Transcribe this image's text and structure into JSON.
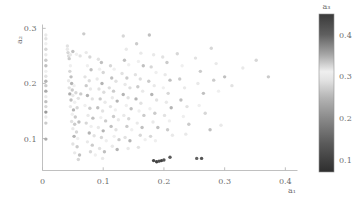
{
  "figure": {
    "background": "#ffffff",
    "point_marker": "circle",
    "colormap": "gray-cyclic-dark-light-dark"
  },
  "axes": {
    "x": {
      "label": "a₁",
      "ticks": [
        "0",
        "0.1",
        "0.2",
        "0.3",
        "0.4"
      ],
      "tick_values": [
        0,
        0.1,
        0.2,
        0.3,
        0.4
      ],
      "range": [
        0.0,
        0.42
      ]
    },
    "y": {
      "label": "a₂",
      "ticks": [
        "0.1",
        "0.2",
        "0.3"
      ],
      "tick_values": [
        0.1,
        0.2,
        0.3
      ],
      "range": [
        0.042,
        0.307
      ]
    }
  },
  "colorbar": {
    "label": "a₃",
    "ticks": [
      "0.1",
      "0.2",
      "0.3",
      "0.4"
    ],
    "tick_values": [
      0.1,
      0.2,
      0.3,
      0.4
    ],
    "range": [
      0.07,
      0.45
    ],
    "orientation": "vertical",
    "position": "right",
    "stops": [
      {
        "value": 0.45,
        "color": "#3a3a3a"
      },
      {
        "value": 0.4,
        "color": "#5f5f5f"
      },
      {
        "value": 0.35,
        "color": "#a8a8a8"
      },
      {
        "value": 0.31,
        "color": "#efefef"
      },
      {
        "value": 0.29,
        "color": "#e2e2e2"
      },
      {
        "value": 0.25,
        "color": "#b4b4b4"
      },
      {
        "value": 0.2,
        "color": "#8a8a8a"
      },
      {
        "value": 0.14,
        "color": "#5a5a5a"
      },
      {
        "value": 0.07,
        "color": "#2e2e2e"
      }
    ]
  },
  "chart_data": {
    "type": "scatter",
    "title": "",
    "xlabel": "a₁",
    "ylabel": "a₂",
    "clabel": "a₃",
    "xlim": [
      0.0,
      0.42
    ],
    "ylim": [
      0.042,
      0.307
    ],
    "clim": [
      0.07,
      0.45
    ],
    "grid": false,
    "legend": "none",
    "colorbar_position": "right",
    "series_name": "samples",
    "n_points": 196,
    "points": [
      [
        0.0055,
        0.288,
        0.3
      ],
      [
        0.0055,
        0.281,
        0.29
      ],
      [
        0.0055,
        0.272,
        0.31
      ],
      [
        0.0055,
        0.262,
        0.28
      ],
      [
        0.0055,
        0.252,
        0.3
      ],
      [
        0.0055,
        0.242,
        0.27
      ],
      [
        0.0055,
        0.232,
        0.26
      ],
      [
        0.0055,
        0.222,
        0.31
      ],
      [
        0.0055,
        0.213,
        0.29
      ],
      [
        0.0055,
        0.204,
        0.25
      ],
      [
        0.0055,
        0.196,
        0.33
      ],
      [
        0.0055,
        0.186,
        0.24
      ],
      [
        0.0055,
        0.176,
        0.3
      ],
      [
        0.0055,
        0.167,
        0.26
      ],
      [
        0.0055,
        0.158,
        0.28
      ],
      [
        0.0055,
        0.148,
        0.22
      ],
      [
        0.0055,
        0.139,
        0.3
      ],
      [
        0.0055,
        0.128,
        0.27
      ],
      [
        0.0055,
        0.099,
        0.24
      ],
      [
        0.041,
        0.268,
        0.29
      ],
      [
        0.041,
        0.262,
        0.3
      ],
      [
        0.042,
        0.256,
        0.28
      ],
      [
        0.043,
        0.25,
        0.32
      ],
      [
        0.044,
        0.245,
        0.27
      ],
      [
        0.046,
        0.252,
        0.3
      ],
      [
        0.05,
        0.258,
        0.26
      ],
      [
        0.056,
        0.253,
        0.31
      ],
      [
        0.062,
        0.25,
        0.29
      ],
      [
        0.046,
        0.232,
        0.31
      ],
      [
        0.045,
        0.222,
        0.28
      ],
      [
        0.047,
        0.212,
        0.26
      ],
      [
        0.043,
        0.205,
        0.3
      ],
      [
        0.048,
        0.2,
        0.25
      ],
      [
        0.044,
        0.192,
        0.29
      ],
      [
        0.049,
        0.188,
        0.27
      ],
      [
        0.052,
        0.196,
        0.31
      ],
      [
        0.045,
        0.181,
        0.24
      ],
      [
        0.05,
        0.178,
        0.3
      ],
      [
        0.055,
        0.183,
        0.28
      ],
      [
        0.047,
        0.17,
        0.26
      ],
      [
        0.053,
        0.166,
        0.31
      ],
      [
        0.059,
        0.173,
        0.29
      ],
      [
        0.063,
        0.181,
        0.27
      ],
      [
        0.046,
        0.158,
        0.3
      ],
      [
        0.051,
        0.152,
        0.25
      ],
      [
        0.057,
        0.156,
        0.28
      ],
      [
        0.049,
        0.144,
        0.31
      ],
      [
        0.054,
        0.139,
        0.27
      ],
      [
        0.048,
        0.131,
        0.29
      ],
      [
        0.053,
        0.126,
        0.33
      ],
      [
        0.06,
        0.13,
        0.26
      ],
      [
        0.05,
        0.118,
        0.3
      ],
      [
        0.056,
        0.112,
        0.28
      ],
      [
        0.052,
        0.104,
        0.25
      ],
      [
        0.058,
        0.1,
        0.31
      ],
      [
        0.05,
        0.09,
        0.29
      ],
      [
        0.057,
        0.085,
        0.27
      ],
      [
        0.053,
        0.074,
        0.3
      ],
      [
        0.061,
        0.07,
        0.26
      ],
      [
        0.059,
        0.062,
        0.28
      ],
      [
        0.068,
        0.29,
        0.27
      ],
      [
        0.072,
        0.256,
        0.3
      ],
      [
        0.078,
        0.248,
        0.28
      ],
      [
        0.074,
        0.232,
        0.31
      ],
      [
        0.08,
        0.225,
        0.26
      ],
      [
        0.07,
        0.212,
        0.29
      ],
      [
        0.077,
        0.205,
        0.32
      ],
      [
        0.072,
        0.196,
        0.27
      ],
      [
        0.079,
        0.19,
        0.3
      ],
      [
        0.074,
        0.178,
        0.25
      ],
      [
        0.082,
        0.172,
        0.29
      ],
      [
        0.07,
        0.16,
        0.31
      ],
      [
        0.078,
        0.155,
        0.27
      ],
      [
        0.075,
        0.142,
        0.3
      ],
      [
        0.083,
        0.137,
        0.26
      ],
      [
        0.072,
        0.128,
        0.28
      ],
      [
        0.08,
        0.122,
        0.31
      ],
      [
        0.077,
        0.11,
        0.25
      ],
      [
        0.085,
        0.105,
        0.29
      ],
      [
        0.074,
        0.094,
        0.3
      ],
      [
        0.082,
        0.088,
        0.27
      ],
      [
        0.079,
        0.076,
        0.28
      ],
      [
        0.087,
        0.07,
        0.31
      ],
      [
        0.092,
        0.244,
        0.29
      ],
      [
        0.097,
        0.238,
        0.26
      ],
      [
        0.094,
        0.226,
        0.31
      ],
      [
        0.1,
        0.22,
        0.28
      ],
      [
        0.09,
        0.208,
        0.3
      ],
      [
        0.098,
        0.2,
        0.25
      ],
      [
        0.093,
        0.19,
        0.29
      ],
      [
        0.101,
        0.184,
        0.32
      ],
      [
        0.095,
        0.172,
        0.27
      ],
      [
        0.103,
        0.166,
        0.3
      ],
      [
        0.091,
        0.156,
        0.26
      ],
      [
        0.099,
        0.15,
        0.29
      ],
      [
        0.096,
        0.138,
        0.31
      ],
      [
        0.104,
        0.132,
        0.27
      ],
      [
        0.092,
        0.12,
        0.3
      ],
      [
        0.1,
        0.114,
        0.25
      ],
      [
        0.097,
        0.102,
        0.28
      ],
      [
        0.105,
        0.096,
        0.31
      ],
      [
        0.094,
        0.082,
        0.29
      ],
      [
        0.102,
        0.076,
        0.26
      ],
      [
        0.099,
        0.064,
        0.3
      ],
      [
        0.112,
        0.232,
        0.28
      ],
      [
        0.118,
        0.226,
        0.31
      ],
      [
        0.114,
        0.21,
        0.26
      ],
      [
        0.121,
        0.204,
        0.29
      ],
      [
        0.11,
        0.192,
        0.32
      ],
      [
        0.117,
        0.186,
        0.27
      ],
      [
        0.115,
        0.174,
        0.3
      ],
      [
        0.123,
        0.168,
        0.25
      ],
      [
        0.112,
        0.158,
        0.29
      ],
      [
        0.12,
        0.152,
        0.31
      ],
      [
        0.117,
        0.14,
        0.27
      ],
      [
        0.125,
        0.134,
        0.3
      ],
      [
        0.113,
        0.122,
        0.26
      ],
      [
        0.121,
        0.116,
        0.29
      ],
      [
        0.118,
        0.104,
        0.31
      ],
      [
        0.126,
        0.098,
        0.27
      ],
      [
        0.115,
        0.086,
        0.3
      ],
      [
        0.123,
        0.08,
        0.25
      ],
      [
        0.133,
        0.286,
        0.28
      ],
      [
        0.138,
        0.262,
        0.3
      ],
      [
        0.135,
        0.242,
        0.26
      ],
      [
        0.142,
        0.234,
        0.31
      ],
      [
        0.131,
        0.218,
        0.29
      ],
      [
        0.139,
        0.21,
        0.27
      ],
      [
        0.136,
        0.198,
        0.3
      ],
      [
        0.144,
        0.192,
        0.32
      ],
      [
        0.133,
        0.18,
        0.25
      ],
      [
        0.141,
        0.174,
        0.29
      ],
      [
        0.138,
        0.16,
        0.31
      ],
      [
        0.146,
        0.154,
        0.26
      ],
      [
        0.134,
        0.142,
        0.3
      ],
      [
        0.142,
        0.136,
        0.28
      ],
      [
        0.139,
        0.122,
        0.27
      ],
      [
        0.147,
        0.116,
        0.31
      ],
      [
        0.136,
        0.102,
        0.29
      ],
      [
        0.144,
        0.096,
        0.25
      ],
      [
        0.141,
        0.082,
        0.3
      ],
      [
        0.155,
        0.272,
        0.27
      ],
      [
        0.162,
        0.255,
        0.3
      ],
      [
        0.158,
        0.24,
        0.31
      ],
      [
        0.166,
        0.232,
        0.26
      ],
      [
        0.153,
        0.216,
        0.29
      ],
      [
        0.161,
        0.208,
        0.32
      ],
      [
        0.157,
        0.194,
        0.27
      ],
      [
        0.165,
        0.186,
        0.3
      ],
      [
        0.154,
        0.172,
        0.25
      ],
      [
        0.162,
        0.164,
        0.29
      ],
      [
        0.159,
        0.15,
        0.31
      ],
      [
        0.167,
        0.142,
        0.27
      ],
      [
        0.156,
        0.128,
        0.3
      ],
      [
        0.164,
        0.12,
        0.26
      ],
      [
        0.161,
        0.106,
        0.28
      ],
      [
        0.169,
        0.098,
        0.31
      ],
      [
        0.158,
        0.084,
        0.29
      ],
      [
        0.176,
        0.288,
        0.26
      ],
      [
        0.183,
        0.252,
        0.3
      ],
      [
        0.179,
        0.23,
        0.28
      ],
      [
        0.187,
        0.22,
        0.31
      ],
      [
        0.175,
        0.204,
        0.27
      ],
      [
        0.184,
        0.196,
        0.3
      ],
      [
        0.18,
        0.18,
        0.25
      ],
      [
        0.188,
        0.17,
        0.29
      ],
      [
        0.177,
        0.154,
        0.31
      ],
      [
        0.185,
        0.146,
        0.27
      ],
      [
        0.182,
        0.13,
        0.3
      ],
      [
        0.19,
        0.12,
        0.26
      ],
      [
        0.178,
        0.104,
        0.28
      ],
      [
        0.186,
        0.096,
        0.31
      ],
      [
        0.183,
        0.06,
        0.11
      ],
      [
        0.188,
        0.058,
        0.1
      ],
      [
        0.192,
        0.059,
        0.12
      ],
      [
        0.196,
        0.06,
        0.1
      ],
      [
        0.2,
        0.061,
        0.13
      ],
      [
        0.198,
        0.248,
        0.29
      ],
      [
        0.205,
        0.238,
        0.27
      ],
      [
        0.202,
        0.216,
        0.3
      ],
      [
        0.21,
        0.206,
        0.26
      ],
      [
        0.199,
        0.192,
        0.31
      ],
      [
        0.207,
        0.182,
        0.28
      ],
      [
        0.204,
        0.166,
        0.3
      ],
      [
        0.212,
        0.156,
        0.25
      ],
      [
        0.201,
        0.142,
        0.29
      ],
      [
        0.209,
        0.132,
        0.31
      ],
      [
        0.206,
        0.116,
        0.27
      ],
      [
        0.214,
        0.106,
        0.3
      ],
      [
        0.21,
        0.066,
        0.14
      ],
      [
        0.222,
        0.254,
        0.28
      ],
      [
        0.23,
        0.232,
        0.31
      ],
      [
        0.226,
        0.208,
        0.27
      ],
      [
        0.234,
        0.192,
        0.3
      ],
      [
        0.228,
        0.17,
        0.26
      ],
      [
        0.238,
        0.158,
        0.29
      ],
      [
        0.232,
        0.14,
        0.31
      ],
      [
        0.241,
        0.126,
        0.27
      ],
      [
        0.236,
        0.108,
        0.3
      ],
      [
        0.252,
        0.246,
        0.29
      ],
      [
        0.26,
        0.222,
        0.27
      ],
      [
        0.256,
        0.2,
        0.3
      ],
      [
        0.265,
        0.182,
        0.26
      ],
      [
        0.258,
        0.16,
        0.31
      ],
      [
        0.268,
        0.146,
        0.28
      ],
      [
        0.254,
        0.064,
        0.15
      ],
      [
        0.262,
        0.064,
        0.13
      ],
      [
        0.278,
        0.264,
        0.28
      ],
      [
        0.286,
        0.236,
        0.3
      ],
      [
        0.282,
        0.206,
        0.27
      ],
      [
        0.29,
        0.186,
        0.31
      ],
      [
        0.3,
        0.212,
        0.26
      ],
      [
        0.312,
        0.196,
        0.29
      ],
      [
        0.33,
        0.228,
        0.3
      ],
      [
        0.352,
        0.242,
        0.28
      ],
      [
        0.372,
        0.212,
        0.27
      ],
      [
        0.294,
        0.124,
        0.3
      ],
      [
        0.276,
        0.116,
        0.26
      ]
    ]
  }
}
